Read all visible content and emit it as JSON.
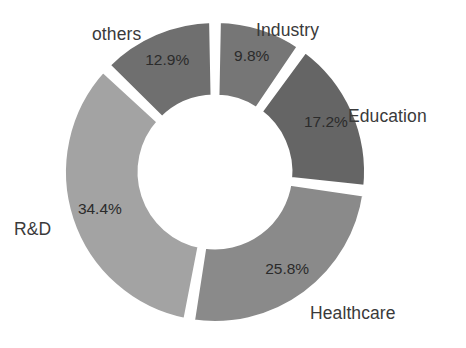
{
  "chart_data": {
    "type": "pie",
    "variant": "donut",
    "title": "",
    "subtitle": "",
    "xlabel": "",
    "ylabel": "",
    "grid": false,
    "legend_position": "outside-labels",
    "value_suffix": "%",
    "start_angle_deg": 0,
    "direction": "clockwise",
    "inner_radius_ratio": 0.49,
    "categories": [
      "Industry",
      "Education",
      "Healthcare",
      "R&D",
      "others"
    ],
    "values": [
      9.8,
      17.2,
      25.8,
      34.4,
      12.9
    ],
    "labels": [
      "9.8%",
      "17.2%",
      "25.8%",
      "34.4%",
      "12.9%"
    ],
    "colors": [
      "#767676",
      "#656565",
      "#8a8a8a",
      "#a3a3a3",
      "#6f6f6f"
    ],
    "slices": [
      {
        "name": "Industry",
        "value": 9.8,
        "label": "9.8%",
        "color": "#767676"
      },
      {
        "name": "Education",
        "value": 17.2,
        "label": "17.2%",
        "color": "#656565"
      },
      {
        "name": "Healthcare",
        "value": 25.8,
        "label": "25.8%",
        "color": "#8a8a8a"
      },
      {
        "name": "R&D",
        "value": 34.4,
        "label": "34.4%",
        "color": "#a3a3a3"
      },
      {
        "name": "others",
        "value": 12.9,
        "label": "12.9%",
        "color": "#6f6f6f"
      }
    ]
  },
  "chart": {
    "background_color": "#ffffff",
    "slice_gap_color": "#ffffff",
    "label_text_color": "#3a3a3a",
    "value_text_color": "#2b2b2b"
  }
}
